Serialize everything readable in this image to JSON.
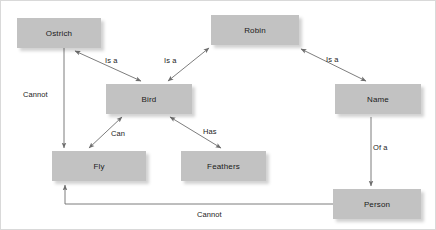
{
  "diagram": {
    "background_color": "#ffffff",
    "node_fill_color": "#c2c2c2",
    "line_color": "#6e6e6e",
    "text_color": "#1a1a1a",
    "nodes": [
      {
        "id": "ostrich",
        "label": "Ostrich",
        "x": 16,
        "y": 17,
        "w": 84,
        "h": 30
      },
      {
        "id": "robin",
        "label": "Robin",
        "x": 210,
        "y": 14,
        "w": 88,
        "h": 30
      },
      {
        "id": "bird",
        "label": "Bird",
        "x": 105,
        "y": 83,
        "w": 86,
        "h": 30
      },
      {
        "id": "name",
        "label": "Name",
        "x": 334,
        "y": 83,
        "w": 86,
        "h": 30
      },
      {
        "id": "fly",
        "label": "Fly",
        "x": 51,
        "y": 150,
        "w": 94,
        "h": 30
      },
      {
        "id": "feathers",
        "label": "Feathers",
        "x": 180,
        "y": 150,
        "w": 85,
        "h": 30
      },
      {
        "id": "person",
        "label": "Person",
        "x": 332,
        "y": 188,
        "w": 88,
        "h": 30
      }
    ],
    "edges": [
      {
        "id": "ostrich-bird",
        "from": "ostrich",
        "to": "bird",
        "label": "Is a",
        "arrows": "both"
      },
      {
        "id": "robin-bird",
        "from": "robin",
        "to": "bird",
        "label": "Is a",
        "arrows": "both"
      },
      {
        "id": "robin-name",
        "from": "robin",
        "to": "name",
        "label": "Is a",
        "arrows": "both"
      },
      {
        "id": "ostrich-fly",
        "from": "ostrich",
        "to": "fly",
        "label": "Cannot",
        "arrows": "end"
      },
      {
        "id": "bird-fly",
        "from": "bird",
        "to": "fly",
        "label": "Can",
        "arrows": "both"
      },
      {
        "id": "bird-feathers",
        "from": "bird",
        "to": "feathers",
        "label": "Has",
        "arrows": "both"
      },
      {
        "id": "name-person",
        "from": "name",
        "to": "person",
        "label": "Of a",
        "arrows": "end"
      },
      {
        "id": "person-fly",
        "from": "person",
        "to": "fly",
        "label": "Cannot",
        "arrows": "end"
      }
    ],
    "edge_labels": [
      {
        "id": "label-ostrich-bird",
        "text": "Is a",
        "x": 104,
        "y": 55
      },
      {
        "id": "label-robin-bird",
        "text": "Is a",
        "x": 163,
        "y": 55
      },
      {
        "id": "label-robin-name",
        "text": "Is a",
        "x": 325,
        "y": 54
      },
      {
        "id": "label-ostrich-fly",
        "text": "Cannot",
        "x": 22,
        "y": 89
      },
      {
        "id": "label-bird-fly",
        "text": "Can",
        "x": 110,
        "y": 128
      },
      {
        "id": "label-bird-feathers",
        "text": "Has",
        "x": 202,
        "y": 126
      },
      {
        "id": "label-name-person",
        "text": "Of a",
        "x": 372,
        "y": 142
      },
      {
        "id": "label-person-fly",
        "text": "Cannot",
        "x": 196,
        "y": 209
      }
    ]
  }
}
